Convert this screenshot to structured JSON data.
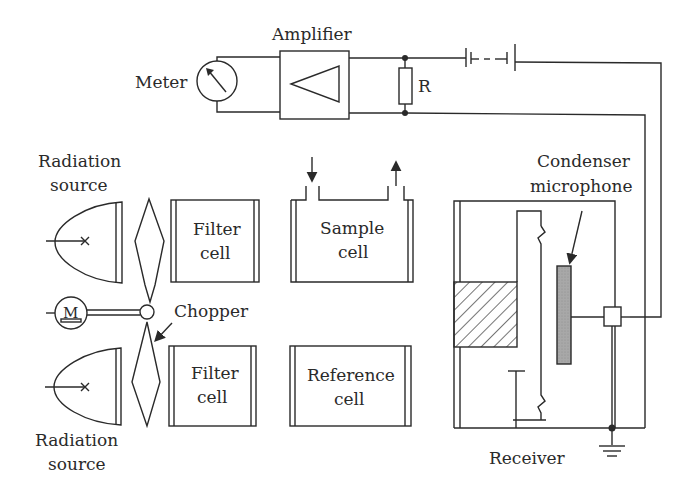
{
  "diagram": {
    "labels": {
      "amplifier": "Amplifier",
      "meter": "Meter",
      "resistor": "R",
      "radiation_source_top_line1": "Radiation",
      "radiation_source_top_line2": "source",
      "radiation_source_bottom_line1": "Radiation",
      "radiation_source_bottom_line2": "source",
      "filter_cell_top_line1": "Filter",
      "filter_cell_top_line2": "cell",
      "filter_cell_bottom_line1": "Filter",
      "filter_cell_bottom_line2": "cell",
      "sample_cell_line1": "Sample",
      "sample_cell_line2": "cell",
      "reference_cell_line1": "Reference",
      "reference_cell_line2": "cell",
      "chopper": "Chopper",
      "motor": "M",
      "condenser_line1": "Condenser",
      "condenser_line2": "microphone",
      "receiver": "Receiver"
    },
    "components": [
      "meter",
      "amplifier",
      "resistor",
      "battery",
      "radiation-source-top",
      "radiation-source-bottom",
      "chopper",
      "motor",
      "filter-cell-top",
      "filter-cell-bottom",
      "sample-cell",
      "reference-cell",
      "receiver",
      "condenser-microphone",
      "ground"
    ],
    "colors": {
      "line": "#2a2a2a",
      "microphone_fill": "#a8a8a8",
      "background": "#ffffff"
    }
  }
}
